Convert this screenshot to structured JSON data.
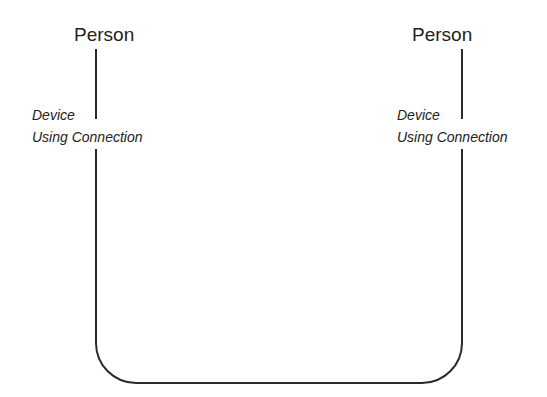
{
  "diagram": {
    "nodes": [
      {
        "id": "person-left",
        "label": "Person",
        "sublabel_line1": "Device",
        "sublabel_line2": "Using Connection"
      },
      {
        "id": "person-right",
        "label": "Person",
        "sublabel_line1": "Device",
        "sublabel_line2": "Using Connection"
      }
    ],
    "edges": [
      {
        "from": "person-left",
        "to": "person-right",
        "shape": "rounded-u-connector"
      }
    ],
    "colors": {
      "line": "#2a2a2a",
      "text": "#222222",
      "background": "#ffffff"
    }
  }
}
